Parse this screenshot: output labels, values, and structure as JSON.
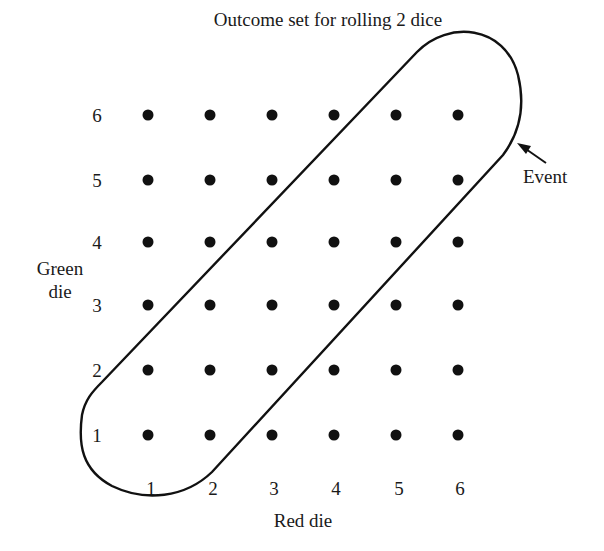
{
  "title": "Outcome set for rolling 2 dice",
  "x_axis": {
    "label": "Red die",
    "ticks": [
      "1",
      "2",
      "3",
      "4",
      "5",
      "6"
    ]
  },
  "y_axis": {
    "label_line1": "Green",
    "label_line2": "die",
    "ticks": [
      "1",
      "2",
      "3",
      "4",
      "5",
      "6"
    ]
  },
  "event_label": "Event",
  "colors": {
    "ink": "#111111",
    "background": "#ffffff"
  },
  "layout": {
    "col_x": [
      148,
      210,
      272,
      334,
      396,
      458
    ],
    "row_y": [
      435,
      370,
      305,
      242,
      180,
      115
    ],
    "dot_radius": 5.5
  },
  "outcomes": {
    "grid_size": [
      6,
      6
    ],
    "event_enclosed": [
      [
        1,
        1
      ],
      [
        1,
        2
      ],
      [
        2,
        1
      ],
      [
        2,
        2
      ],
      [
        2,
        3
      ],
      [
        3,
        2
      ],
      [
        3,
        3
      ],
      [
        3,
        4
      ],
      [
        4,
        3
      ],
      [
        4,
        4
      ],
      [
        4,
        5
      ],
      [
        5,
        4
      ],
      [
        5,
        5
      ],
      [
        5,
        6
      ],
      [
        6,
        5
      ],
      [
        6,
        6
      ]
    ]
  }
}
